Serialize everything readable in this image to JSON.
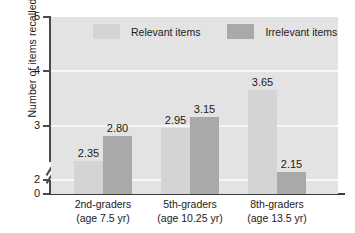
{
  "chart_data": {
    "type": "bar",
    "title": "",
    "xlabel": "",
    "ylabel": "Number of items recalled",
    "ylim": [
      0,
      5
    ],
    "y_axis_break": true,
    "y_break_between": [
      0,
      2
    ],
    "yticks": [
      "0",
      "2",
      "3",
      "4",
      "5"
    ],
    "ytick_values": [
      0,
      2,
      3,
      4,
      5
    ],
    "gridlines": [
      2,
      3,
      4
    ],
    "grid": true,
    "legend_position": "top-inside",
    "categories": [
      "2nd-graders",
      "5th-graders",
      "8th-graders"
    ],
    "category_sublabels": [
      "(age 7.5 yr)",
      "(age 10.25 yr)",
      "(age 13.5 yr)"
    ],
    "series": [
      {
        "name": "Relevant items",
        "color": "#d4d4d4",
        "values": [
          2.35,
          2.95,
          3.65
        ],
        "labels": [
          "2.35",
          "2.95",
          "3.65"
        ]
      },
      {
        "name": "Irrelevant items",
        "color": "#a9a9a9",
        "values": [
          2.8,
          3.15,
          2.15
        ],
        "labels": [
          "2.80",
          "3.15",
          "2.15"
        ]
      }
    ]
  },
  "colors": {
    "plot_background": "#e3e3e3",
    "gridline": "#f7f7f7",
    "axis": "#454545",
    "relevant_bar": "#d4d4d4",
    "irrelevant_bar": "#a9a9a9",
    "text": "#1b1b1b"
  }
}
